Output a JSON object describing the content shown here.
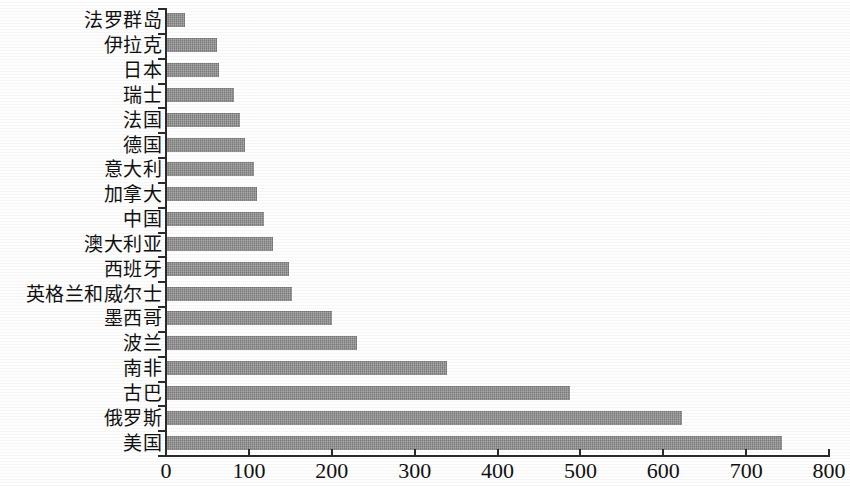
{
  "chart_data": {
    "type": "bar",
    "orientation": "horizontal",
    "title": "",
    "subtitle": "",
    "xlabel": "",
    "ylabel": "",
    "xlim": [
      0,
      800
    ],
    "ylim": null,
    "grid": false,
    "legend": null,
    "legend_position": "none",
    "xticks": [
      "0",
      "100",
      "200",
      "300",
      "400",
      "500",
      "600",
      "700",
      "800"
    ],
    "xtick_values": [
      0,
      100,
      200,
      300,
      400,
      500,
      600,
      700,
      800
    ],
    "bar_color": "#8b8b8b",
    "axis_color": "#2b2b2b",
    "background_color": "#ffffff",
    "categories": [
      "法罗群岛",
      "伊拉克",
      "日本",
      "瑞士",
      "法国",
      "德国",
      "意大利",
      "加拿大",
      "中国",
      "澳大利亚",
      "西班牙",
      "英格兰和威尔士",
      "墨西哥",
      "波兰",
      "南非",
      "古巴",
      "俄罗斯",
      "美国"
    ],
    "values": [
      22,
      60,
      63,
      81,
      88,
      94,
      105,
      108,
      117,
      128,
      147,
      151,
      199,
      229,
      338,
      486,
      622,
      742
    ]
  }
}
